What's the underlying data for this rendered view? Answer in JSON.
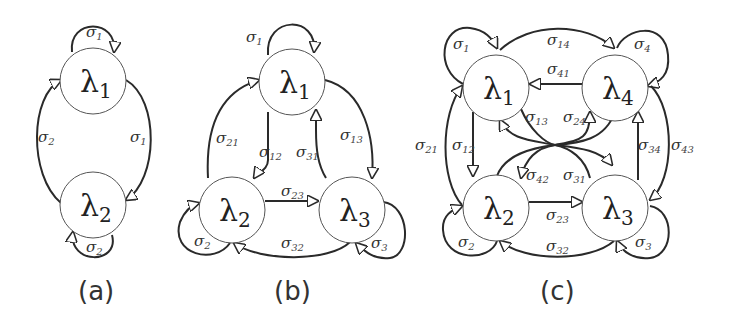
{
  "figure": {
    "panels": [
      {
        "id": "a",
        "caption": "(a)",
        "states": [
          {
            "symbol": "λ",
            "sub": "1"
          },
          {
            "symbol": "λ",
            "sub": "2"
          }
        ],
        "edge_labels": [
          {
            "symbol": "σ",
            "sub": "1",
            "role": "self-loop on λ1"
          },
          {
            "symbol": "σ",
            "sub": "2",
            "role": "λ2 → λ1"
          },
          {
            "symbol": "σ",
            "sub": "1",
            "role": "λ1 → λ2"
          },
          {
            "symbol": "σ",
            "sub": "2",
            "role": "self-loop on λ2"
          }
        ]
      },
      {
        "id": "b",
        "caption": "(b)",
        "states": [
          {
            "symbol": "λ",
            "sub": "1"
          },
          {
            "symbol": "λ",
            "sub": "2"
          },
          {
            "symbol": "λ",
            "sub": "3"
          }
        ],
        "edge_labels": [
          {
            "symbol": "σ",
            "sub": "1",
            "role": "self-loop on λ1"
          },
          {
            "symbol": "σ",
            "sub": "21",
            "role": "λ2 → λ1"
          },
          {
            "symbol": "σ",
            "sub": "12",
            "role": "λ1 → λ2"
          },
          {
            "symbol": "σ",
            "sub": "31",
            "role": "λ3 → λ1"
          },
          {
            "symbol": "σ",
            "sub": "13",
            "role": "λ1 → λ3"
          },
          {
            "symbol": "σ",
            "sub": "23",
            "role": "λ2 → λ3"
          },
          {
            "symbol": "σ",
            "sub": "32",
            "role": "λ3 → λ2"
          },
          {
            "symbol": "σ",
            "sub": "2",
            "role": "self-loop on λ2"
          },
          {
            "symbol": "σ",
            "sub": "3",
            "role": "self-loop on λ3"
          }
        ]
      },
      {
        "id": "c",
        "caption": "(c)",
        "states": [
          {
            "symbol": "λ",
            "sub": "1"
          },
          {
            "symbol": "λ",
            "sub": "4"
          },
          {
            "symbol": "λ",
            "sub": "2"
          },
          {
            "symbol": "λ",
            "sub": "3"
          }
        ],
        "edge_labels": [
          {
            "symbol": "σ",
            "sub": "1",
            "role": "self-loop on λ1"
          },
          {
            "symbol": "σ",
            "sub": "14",
            "role": "λ1 → λ4"
          },
          {
            "symbol": "σ",
            "sub": "4",
            "role": "self-loop on λ4"
          },
          {
            "symbol": "σ",
            "sub": "41",
            "role": "λ4 → λ1"
          },
          {
            "symbol": "σ",
            "sub": "13",
            "role": "λ1 → λ3"
          },
          {
            "symbol": "σ",
            "sub": "24",
            "role": "λ2 → λ4"
          },
          {
            "symbol": "σ",
            "sub": "21",
            "role": "λ2 → λ1"
          },
          {
            "symbol": "σ",
            "sub": "12",
            "role": "λ1 → λ2"
          },
          {
            "symbol": "σ",
            "sub": "34",
            "role": "λ3 → λ4"
          },
          {
            "symbol": "σ",
            "sub": "43",
            "role": "λ4 → λ3"
          },
          {
            "symbol": "σ",
            "sub": "42",
            "role": "λ4 → λ2"
          },
          {
            "symbol": "σ",
            "sub": "31",
            "role": "λ3 → λ1"
          },
          {
            "symbol": "σ",
            "sub": "23",
            "role": "λ2 → λ3"
          },
          {
            "symbol": "σ",
            "sub": "32",
            "role": "λ3 → λ2"
          },
          {
            "symbol": "σ",
            "sub": "2",
            "role": "self-loop on λ2"
          },
          {
            "symbol": "σ",
            "sub": "3",
            "role": "self-loop on λ3"
          }
        ]
      }
    ]
  }
}
